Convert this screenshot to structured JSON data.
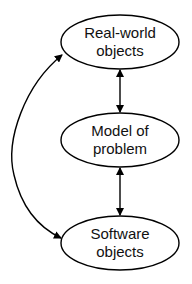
{
  "diagram": {
    "nodes": [
      {
        "id": "real",
        "line1": "Real-world",
        "line2": "objects"
      },
      {
        "id": "model",
        "line1": "Model of",
        "line2": "problem"
      },
      {
        "id": "software",
        "line1": "Software",
        "line2": "objects"
      }
    ],
    "edges": [
      {
        "from": "real",
        "to": "model",
        "type": "bidirectional"
      },
      {
        "from": "model",
        "to": "software",
        "type": "bidirectional"
      },
      {
        "from": "real",
        "to": "software",
        "type": "bidirectional-curved"
      }
    ],
    "colors": {
      "stroke": "#000000",
      "background": "#ffffff"
    }
  }
}
